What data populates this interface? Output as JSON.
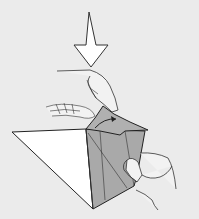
{
  "figure": {
    "type": "origami-instruction",
    "colors": {
      "background": "#ebebeb",
      "paper_light": "#ffffff",
      "paper_dark": "#a9a9a9",
      "paper_mid": "#b8b8b8",
      "line": "#2a2a2a",
      "skin": "#f2f2f2"
    },
    "elements": {
      "push_arrow": "down-arrow",
      "fold_arrow": "curved-arrow"
    }
  }
}
